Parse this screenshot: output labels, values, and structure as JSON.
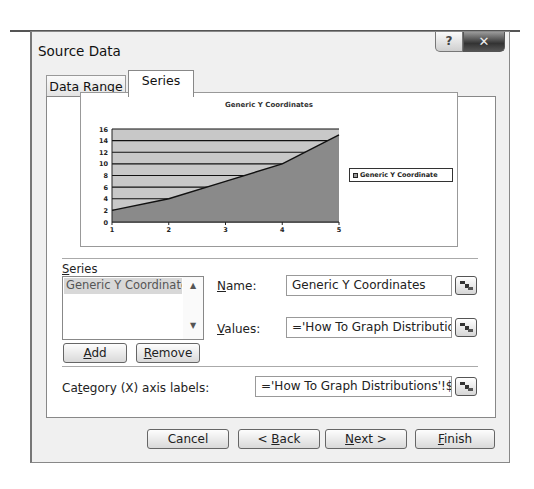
{
  "window": {
    "title": "Source Data",
    "help_icon": "?",
    "close_icon": "✕"
  },
  "tabs": [
    {
      "label": "Data Range",
      "active": false
    },
    {
      "label": "Series",
      "active": true
    }
  ],
  "chart_data": {
    "type": "area",
    "title": "Generic Y Coordinates",
    "categories": [
      "1",
      "2",
      "3",
      "4",
      "5"
    ],
    "series": [
      {
        "name": "Generic Y Coordinates",
        "values": [
          2,
          4,
          7,
          10,
          15
        ]
      }
    ],
    "xlabel": "",
    "ylabel": "",
    "ylim": [
      0,
      16
    ],
    "yticks": [
      0,
      2,
      4,
      6,
      8,
      10,
      12,
      14,
      16
    ],
    "grid": true,
    "legend_position": "right",
    "legend_label": "Generic Y Coordinate"
  },
  "series_section": {
    "label_prefix": "",
    "label_underlined": "S",
    "label_rest": "eries",
    "list_items": [
      "Generic Y Coordinate"
    ],
    "scroll_up": "▲",
    "scroll_down": "▼",
    "add_button": {
      "u": "A",
      "rest": "dd"
    },
    "remove_button": {
      "u": "R",
      "rest": "emove"
    }
  },
  "name_field": {
    "label_u": "N",
    "label_rest": "ame:",
    "value": "Generic Y Coordinates"
  },
  "values_field": {
    "label_u": "V",
    "label_rest": "alues:",
    "value": "='How To Graph Distributions"
  },
  "category_field": {
    "label_pre": "Ca",
    "label_u": "t",
    "label_rest": "egory (X) axis labels:",
    "value": "='How To Graph Distributions'!$A$1"
  },
  "footer": {
    "cancel": "Cancel",
    "back": {
      "pre": "< ",
      "u": "B",
      "rest": "ack"
    },
    "next": {
      "u": "N",
      "rest": "ext >"
    },
    "finish": {
      "u": "F",
      "rest": "inish"
    }
  }
}
